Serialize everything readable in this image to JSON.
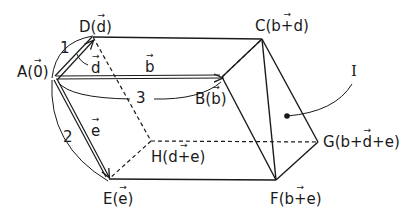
{
  "diagram": {
    "type": "parallelepiped-vectors",
    "colors": {
      "stroke": "#1a1a1a",
      "background": "#ffffff"
    },
    "vertices": {
      "A": {
        "name": "A",
        "vec": "0",
        "suffix": ""
      },
      "B": {
        "name": "B",
        "vec": "b",
        "suffix": ""
      },
      "C": {
        "name": "C",
        "vec": "b+d",
        "suffix": ""
      },
      "D": {
        "name": "D",
        "vec": "d",
        "suffix": ""
      },
      "E": {
        "name": "E",
        "vec": "e",
        "suffix": ""
      },
      "F": {
        "name": "F",
        "vec": "b+e",
        "suffix": ""
      },
      "G": {
        "name": "G",
        "vec": "b+d+e",
        "suffix": ""
      },
      "H": {
        "name": "H",
        "vec": "d+e",
        "suffix": ""
      }
    },
    "edge_vectors": {
      "d": "d",
      "b": "b",
      "e": "e"
    },
    "arc_labels": {
      "one": "1",
      "two": "2",
      "three": "3"
    },
    "plane_label": "I"
  }
}
